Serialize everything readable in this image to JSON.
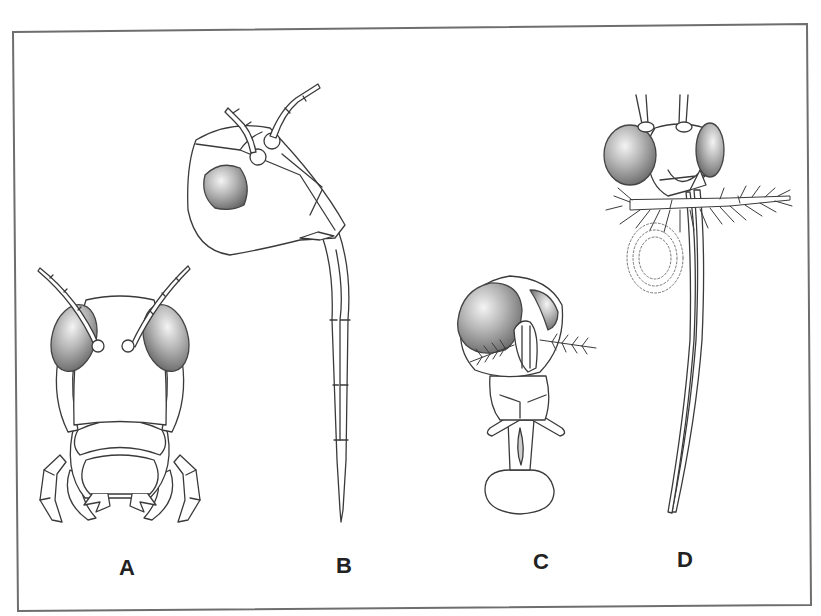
{
  "figure": {
    "panels": [
      {
        "id": "A",
        "label": "A",
        "subject": "insect head, frontal view, with antennae, compound eyes and mouthparts/forelegs"
      },
      {
        "id": "B",
        "label": "B",
        "subject": "insect head, lateral view, with elongated segmented proboscis"
      },
      {
        "id": "C",
        "label": "C",
        "subject": "fly head, anterior view, with plumose antennae and labellum"
      },
      {
        "id": "D",
        "label": "D",
        "subject": "mosquito-like head with plumose palps and long proboscis, coiled structure (dotted)"
      }
    ],
    "colors": {
      "line": "#3a3a3a",
      "frame": "#6e6e6e",
      "eye_light": "#f2f2f2",
      "eye_dark": "#6a6a6a",
      "background": "#ffffff"
    }
  }
}
